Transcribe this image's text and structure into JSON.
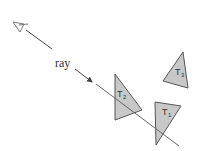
{
  "diagram": {
    "eye": {
      "icon": "eye-icon",
      "x": 20,
      "y": 26
    },
    "ray": {
      "label": "ray",
      "color": "#666666"
    },
    "triangles": [
      {
        "id": "T2",
        "label": "T",
        "subscript": "2",
        "fill": "#c8c8c8",
        "stroke": "#555555"
      },
      {
        "id": "T1",
        "label": "T",
        "subscript": "1",
        "fill": "#c8c8c8",
        "stroke": "#555555"
      },
      {
        "id": "T3",
        "label": "T",
        "subscript": "3",
        "fill": "#c8c8c8",
        "stroke": "#555555"
      }
    ]
  }
}
